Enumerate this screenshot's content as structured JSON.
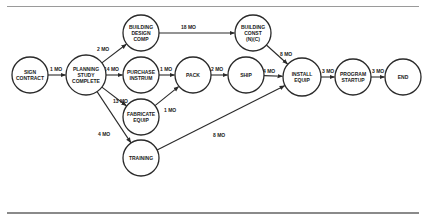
{
  "diagram": {
    "type": "PERT network",
    "nodes": [
      {
        "id": "sign",
        "lines": [
          "SIGN",
          "CONTRACT"
        ],
        "cx": 30,
        "cy": 75,
        "r": 18
      },
      {
        "id": "plan",
        "lines": [
          "PLANNING",
          "STUDY",
          "COMPLETE"
        ],
        "cx": 86,
        "cy": 75,
        "r": 20
      },
      {
        "id": "bdc",
        "lines": [
          "BUILDING",
          "DESIGN",
          "COMP"
        ],
        "cx": 141,
        "cy": 33,
        "r": 18
      },
      {
        "id": "bcn",
        "lines": [
          "BUILDING",
          "CONST",
          "(N)(C)"
        ],
        "cx": 253,
        "cy": 33,
        "r": 18
      },
      {
        "id": "pur",
        "lines": [
          "PURCHASE",
          "INSTRUM"
        ],
        "cx": 141,
        "cy": 75,
        "r": 18
      },
      {
        "id": "pack",
        "lines": [
          "PACK"
        ],
        "cx": 193,
        "cy": 75,
        "r": 18
      },
      {
        "id": "ship",
        "lines": [
          "SHIP"
        ],
        "cx": 246,
        "cy": 75,
        "r": 18
      },
      {
        "id": "inst",
        "lines": [
          "INSTALL",
          "EQUIP"
        ],
        "cx": 302,
        "cy": 77,
        "r": 19
      },
      {
        "id": "prog",
        "lines": [
          "PROGRAM",
          "STARTUP"
        ],
        "cx": 353,
        "cy": 77,
        "r": 18
      },
      {
        "id": "end",
        "lines": [
          "END"
        ],
        "cx": 403,
        "cy": 77,
        "r": 18
      },
      {
        "id": "fab",
        "lines": [
          "FABRICATE",
          "EQUIP"
        ],
        "cx": 141,
        "cy": 117,
        "r": 18
      },
      {
        "id": "train",
        "lines": [
          "TRAINING"
        ],
        "cx": 141,
        "cy": 158,
        "r": 18
      }
    ],
    "edges": [
      {
        "from": "sign",
        "to": "plan",
        "label": "1 MO",
        "lx": 50,
        "ly": 71
      },
      {
        "from": "plan",
        "to": "bdc",
        "label": "2 MO",
        "lx": 97,
        "ly": 51
      },
      {
        "from": "plan",
        "to": "pur",
        "label": "14 MO",
        "lx": 104,
        "ly": 71
      },
      {
        "from": "plan",
        "to": "fab",
        "label": "13 MO",
        "lx": 113,
        "ly": 103
      },
      {
        "from": "plan",
        "to": "train",
        "label": "4 MO",
        "lx": 98,
        "ly": 136
      },
      {
        "from": "bdc",
        "to": "bcn",
        "label": "18 MO",
        "lx": 181,
        "ly": 29
      },
      {
        "from": "pur",
        "to": "pack",
        "label": "1 MO",
        "lx": 160,
        "ly": 71
      },
      {
        "from": "fab",
        "to": "pack",
        "label": "1 MO",
        "lx": 164,
        "ly": 112
      },
      {
        "from": "pack",
        "to": "ship",
        "label": "2 MO",
        "lx": 211,
        "ly": 71
      },
      {
        "from": "bcn",
        "to": "inst",
        "label": "8 MO",
        "lx": 280,
        "ly": 56
      },
      {
        "from": "ship",
        "to": "inst",
        "label": "4 MO",
        "lx": 263,
        "ly": 73
      },
      {
        "from": "train",
        "to": "inst",
        "label": "8 MO",
        "lx": 213,
        "ly": 137
      },
      {
        "from": "inst",
        "to": "prog",
        "label": "3 MO",
        "lx": 322,
        "ly": 73
      },
      {
        "from": "prog",
        "to": "end",
        "label": "3 MO",
        "lx": 372,
        "ly": 73
      }
    ]
  }
}
